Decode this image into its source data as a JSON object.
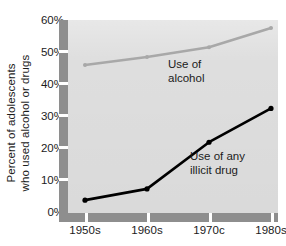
{
  "chart_data": {
    "type": "line",
    "title": "",
    "xlabel": "",
    "ylabel": "Percent of adolescents who used alcohol or drugs",
    "categories": [
      "1950s",
      "1960s",
      "1970s",
      "1980s"
    ],
    "x_tick_labels": [
      "1950s",
      "1960s",
      "1970c",
      "1980s"
    ],
    "y_tick_labels": [
      "0%",
      "10%",
      "20%",
      "30%",
      "40%",
      "50%",
      "60%"
    ],
    "y_tick_values": [
      0,
      10,
      20,
      30,
      40,
      50,
      60
    ],
    "ylim": [
      0,
      60
    ],
    "grid": false,
    "legend_position": "inline-annotations",
    "series": [
      {
        "name": "Use of alcohol",
        "label_line1": "Use of",
        "label_line2": "alcohol",
        "color": "#a8a8a8",
        "marker": "dot",
        "values": [
          46,
          48.5,
          51.5,
          57.5
        ]
      },
      {
        "name": "Use of any illicit drug",
        "label_line1": "Use of any",
        "label_line2": "illicit drug",
        "color": "#000000",
        "marker": "dot",
        "values": [
          4,
          7.5,
          22,
          32.5
        ]
      }
    ]
  },
  "axes": {
    "ylabel_line1": "Percent of adolescents",
    "ylabel_line2": "who used alcohol or drugs",
    "yticks": [
      {
        "label": "60%",
        "value": 60
      },
      {
        "label": "50%",
        "value": 50
      },
      {
        "label": "40%",
        "value": 40
      },
      {
        "label": "30%",
        "value": 30
      },
      {
        "label": "20%",
        "value": 20
      },
      {
        "label": "10%",
        "value": 10
      },
      {
        "label": "0%",
        "value": 0
      }
    ],
    "xticks": [
      {
        "label": "1950s"
      },
      {
        "label": "1960s"
      },
      {
        "label": "1970c"
      },
      {
        "label": "1980s"
      }
    ]
  },
  "annotations": {
    "alcohol": {
      "line1": "Use of",
      "line2": "alcohol"
    },
    "illicit": {
      "line1": "Use of any",
      "line2": "illicit drug"
    }
  },
  "colors": {
    "plot_background": "#dedede",
    "axis_band": "#8e8e8e",
    "alcohol_line": "#a8a8a8",
    "illicit_line": "#000000",
    "text": "#1b1b1b"
  }
}
